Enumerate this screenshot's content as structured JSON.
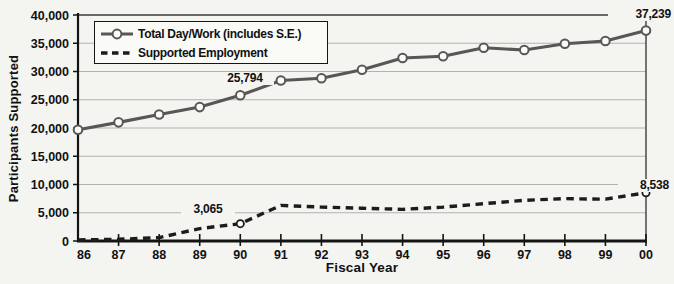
{
  "chart_data": {
    "type": "line",
    "title": "",
    "xlabel": "Fiscal Year",
    "ylabel": "Participants Supported",
    "categories": [
      "86",
      "87",
      "88",
      "89",
      "90",
      "91",
      "92",
      "93",
      "94",
      "95",
      "96",
      "97",
      "98",
      "99",
      "00"
    ],
    "ylim": [
      0,
      40000
    ],
    "y_tick_step": 5000,
    "y_tick_labels": [
      "0",
      "5,000",
      "10,000",
      "15,000",
      "20,000",
      "25,000",
      "30,000",
      "35,000",
      "40,000"
    ],
    "grid": "horizontal-only",
    "legend_position": "top-left-inside",
    "series": [
      {
        "name": "Total Day/Work (includes S.E.)",
        "style": "solid",
        "marker": "circle-every-point",
        "color": "#575757",
        "values": [
          19700,
          21000,
          22400,
          23700,
          25794,
          28400,
          28800,
          30300,
          32400,
          32700,
          34200,
          33800,
          34900,
          35400,
          37239
        ]
      },
      {
        "name": "Supported Employment",
        "style": "dashed",
        "marker": "circle-at-annotated-points",
        "marker_at": [
          "90",
          "00"
        ],
        "color": "#1c1c1c",
        "values": [
          200,
          300,
          600,
          2200,
          3065,
          6300,
          6000,
          5800,
          5600,
          6000,
          6600,
          7200,
          7500,
          7400,
          8538
        ]
      }
    ],
    "annotations": [
      {
        "id": "total-00",
        "series": "Total Day/Work (includes S.E.)",
        "category": "00",
        "value": 37239,
        "label": "37,239"
      },
      {
        "id": "total-90",
        "series": "Total Day/Work (includes S.E.)",
        "category": "90",
        "value": 25794,
        "label": "25,794"
      },
      {
        "id": "supported-90",
        "series": "Supported Employment",
        "category": "90",
        "value": 3065,
        "label": "3,065"
      },
      {
        "id": "supported-00",
        "series": "Supported Employment",
        "category": "00",
        "value": 8538,
        "label": "8,538"
      }
    ],
    "colors": {
      "background": "#f4f4f1",
      "gridline": "#b2b2b0",
      "plot_border": "#3c3c3c",
      "axis": "#141414",
      "text": "#111111",
      "marker_fill": "#fbfbf8"
    }
  }
}
